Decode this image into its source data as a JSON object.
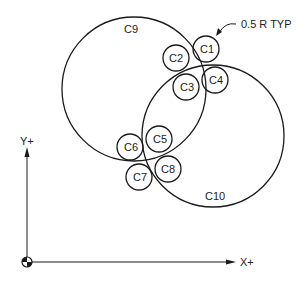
{
  "annotation": {
    "label": "0.5 R TYP"
  },
  "axes": {
    "x_label": "X+",
    "y_label": "Y+"
  },
  "circles": {
    "c1": {
      "label": "C1"
    },
    "c2": {
      "label": "C2"
    },
    "c3": {
      "label": "C3"
    },
    "c4": {
      "label": "C4"
    },
    "c5": {
      "label": "C5"
    },
    "c6": {
      "label": "C6"
    },
    "c7": {
      "label": "C7"
    },
    "c8": {
      "label": "C8"
    },
    "c9": {
      "label": "C9"
    },
    "c10": {
      "label": "C10"
    }
  },
  "colors": {
    "line": "#1a1a1a",
    "background": "#ffffff"
  }
}
